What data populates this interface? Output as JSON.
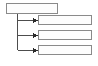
{
  "diagram": {
    "type": "hierarchy-tree",
    "title": "",
    "canvas": {
      "width": 98,
      "height": 66,
      "background": "#ffffff"
    },
    "style": {
      "box_border_color": "#8a8a8a",
      "box_fill_color": "#fdfdfd",
      "connector_color": "#4d4d4d",
      "arrowhead_color": "#2b2b2b",
      "box_border_width": 1,
      "connector_width": 1
    },
    "parent": {
      "label": "",
      "x": 6,
      "y": 3,
      "width": 52,
      "height": 11
    },
    "trunk": {
      "x": 17,
      "y_top": 14,
      "y_bottom": 50
    },
    "children": [
      {
        "label": "",
        "x": 38,
        "y": 15,
        "width": 54,
        "height": 10,
        "branch_y": 20
      },
      {
        "label": "",
        "x": 38,
        "y": 30,
        "width": 54,
        "height": 10,
        "branch_y": 35
      },
      {
        "label": "",
        "x": 38,
        "y": 45,
        "width": 54,
        "height": 10,
        "branch_y": 50
      }
    ],
    "connectors": [
      {
        "from": "parent",
        "to": "child-1",
        "arrow": true
      },
      {
        "from": "parent",
        "to": "child-2",
        "arrow": true
      },
      {
        "from": "parent",
        "to": "child-3",
        "arrow": true
      }
    ]
  }
}
